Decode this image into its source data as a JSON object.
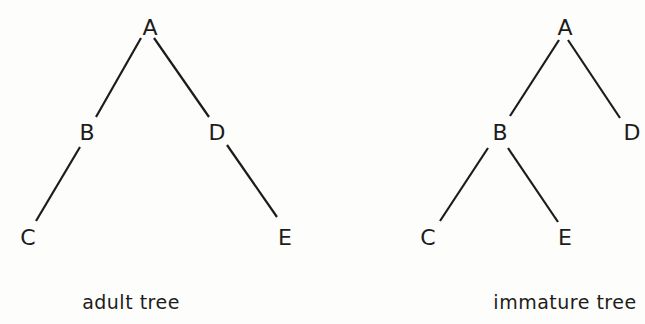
{
  "diagram": {
    "trees": [
      {
        "caption": "adult tree",
        "caption_pos": {
          "x": 131,
          "y": 302
        },
        "nodes": [
          {
            "id": "A",
            "label": "A",
            "x": 150,
            "y": 27
          },
          {
            "id": "B",
            "label": "B",
            "x": 87,
            "y": 132
          },
          {
            "id": "D",
            "label": "D",
            "x": 217,
            "y": 132
          },
          {
            "id": "C",
            "label": "C",
            "x": 28,
            "y": 237
          },
          {
            "id": "E",
            "label": "E",
            "x": 285,
            "y": 237
          }
        ],
        "edges": [
          {
            "from": "A",
            "to": "B",
            "x1": 141,
            "y1": 38,
            "x2": 96,
            "y2": 117
          },
          {
            "from": "A",
            "to": "D",
            "x1": 154,
            "y1": 38,
            "x2": 209,
            "y2": 117
          },
          {
            "from": "B",
            "to": "C",
            "x1": 80,
            "y1": 147,
            "x2": 36,
            "y2": 221
          },
          {
            "from": "D",
            "to": "E",
            "x1": 227,
            "y1": 145,
            "x2": 277,
            "y2": 217
          }
        ]
      },
      {
        "caption": "immature tree",
        "caption_pos": {
          "x": 565,
          "y": 302
        },
        "nodes": [
          {
            "id": "A",
            "label": "A",
            "x": 565,
            "y": 27
          },
          {
            "id": "B",
            "label": "B",
            "x": 500,
            "y": 132
          },
          {
            "id": "D",
            "label": "D",
            "x": 632,
            "y": 132
          },
          {
            "id": "C",
            "label": "C",
            "x": 428,
            "y": 237
          },
          {
            "id": "E",
            "label": "E",
            "x": 565,
            "y": 237
          }
        ],
        "edges": [
          {
            "from": "A",
            "to": "B",
            "x1": 559,
            "y1": 40,
            "x2": 510,
            "y2": 116
          },
          {
            "from": "A",
            "to": "D",
            "x1": 568,
            "y1": 40,
            "x2": 620,
            "y2": 118
          },
          {
            "from": "B",
            "to": "C",
            "x1": 488,
            "y1": 148,
            "x2": 440,
            "y2": 221
          },
          {
            "from": "B",
            "to": "E",
            "x1": 508,
            "y1": 148,
            "x2": 558,
            "y2": 222
          }
        ]
      }
    ]
  }
}
